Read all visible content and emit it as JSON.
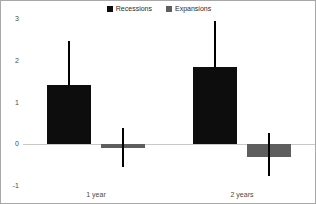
{
  "chart_data": {
    "type": "bar",
    "title": "",
    "subtitle": "",
    "xlabel": "",
    "ylabel": "",
    "categories": [
      "1 year",
      "2 years"
    ],
    "series": [
      {
        "name": "Recessions",
        "color": "#0d0d0d",
        "values": [
          1.43,
          1.85
        ],
        "error_high": [
          2.47,
          2.96
        ],
        "error_low": [
          1.43,
          1.85
        ]
      },
      {
        "name": "Expansions",
        "color": "#5e5e5e",
        "values": [
          -0.1,
          -0.3
        ],
        "error_high": [
          0.4,
          0.27
        ],
        "error_low": [
          -0.54,
          -0.77
        ]
      }
    ],
    "ylim": [
      -1,
      3
    ],
    "yticks": [
      3,
      2,
      1,
      0,
      -1
    ],
    "ytick_labels": [
      "3",
      "2",
      "1",
      "0",
      "-1"
    ],
    "grid": false,
    "legend_position": "top-center",
    "zero_line": true
  },
  "legend": {
    "items": [
      {
        "label": "Recessions",
        "color": "#0d0d0d"
      },
      {
        "label": "Expansions",
        "color": "#5e5e5e"
      }
    ]
  },
  "axis": {
    "y_labels": [
      "3",
      "2",
      "1",
      "0",
      "-1"
    ],
    "x_labels": [
      "1 year",
      "2 years"
    ]
  },
  "colors": {
    "recessions": "#0d0d0d",
    "expansions": "#5e5e5e",
    "zero_line": "#c9c9c9",
    "border": "#a8a8a8",
    "text": "#4a4a4a",
    "background": "#ffffff"
  }
}
